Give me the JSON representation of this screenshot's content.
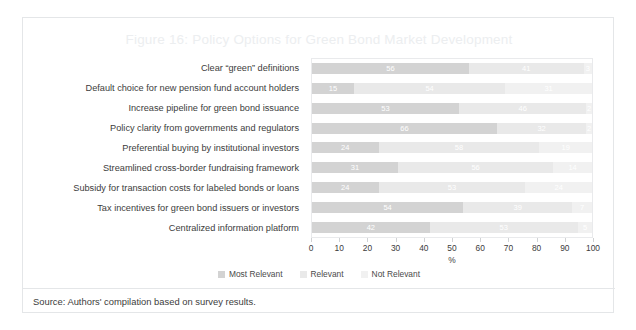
{
  "figure": {
    "title": "Figure 16: Policy Options for Green Bond Market Development",
    "source": "Source: Authors' compilation based on survey results."
  },
  "colors": {
    "most_relevant": "#d3d3d3",
    "relevant": "#e9e9e9",
    "not_relevant": "#f1f1f1",
    "title": "#eceef0",
    "text": "#3c3c3c",
    "card_border": "#e4e6e8"
  },
  "chart_data": {
    "type": "bar",
    "orientation": "horizontal",
    "stacked": true,
    "title": "Figure 16: Policy Options for Green Bond Market Development",
    "xlabel": "%",
    "ylabel": "",
    "xlim": [
      0,
      100
    ],
    "grid": false,
    "legend_position": "bottom",
    "tick_labels": [
      "0",
      "10",
      "20",
      "30",
      "40",
      "50",
      "60",
      "70",
      "80",
      "90",
      "100"
    ],
    "tick_values": [
      0,
      10,
      20,
      30,
      40,
      50,
      60,
      70,
      80,
      90,
      100
    ],
    "categories": [
      "Clear “green” definitions",
      "Default choice for new pension fund account holders",
      "Increase pipeline for green bond issuance",
      "Policy clarity from governments and regulators",
      "Preferential buying by institutional investors",
      "Streamlined cross-border fundraising framework",
      "Subsidy for transaction costs for labeled bonds or loans",
      "Tax incentives for green bond issuers or investors",
      "Centralized information platform"
    ],
    "series": [
      {
        "name": "Most Relevant",
        "color": "#d3d3d3",
        "values": [
          56,
          15,
          53,
          66,
          24,
          31,
          24,
          54,
          42
        ]
      },
      {
        "name": "Relevant",
        "color": "#e9e9e9",
        "values": [
          41,
          54,
          46,
          32,
          58,
          56,
          53,
          39,
          53
        ]
      },
      {
        "name": "Not Relevant",
        "color": "#f1f1f1",
        "values": [
          3,
          31,
          2,
          2,
          19,
          14,
          24,
          7,
          5
        ]
      }
    ]
  }
}
